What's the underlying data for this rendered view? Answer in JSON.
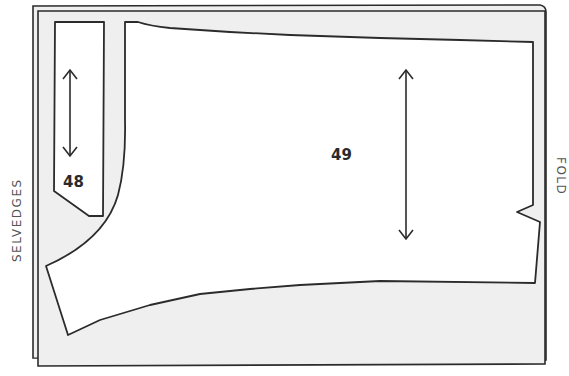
{
  "diagram": {
    "type": "sewing-pattern-layout",
    "labels": {
      "left_edge": "SELVEDGES",
      "right_edge": "FOLD"
    },
    "pieces": [
      {
        "id": "48",
        "label": "48",
        "grainline": "vertical-double-arrow"
      },
      {
        "id": "49",
        "label": "49",
        "grainline": "vertical-double-arrow"
      }
    ],
    "colors": {
      "fabric": "#efefef",
      "piece": "#ffffff",
      "outline": "#2b2b2b",
      "text": "#333333"
    }
  }
}
